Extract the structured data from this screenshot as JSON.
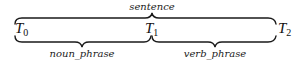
{
  "diagram": {
    "top_brace": {
      "label": "sentence",
      "from": "T0",
      "to": "T2"
    },
    "tokens": [
      {
        "name": "T",
        "sub": "0"
      },
      {
        "name": "T",
        "sub": "1"
      },
      {
        "name": "T",
        "sub": "2"
      }
    ],
    "bottom_braces": [
      {
        "label": "noun_phrase",
        "from": "T0",
        "to": "T1"
      },
      {
        "label": "verb_phrase",
        "from": "T1",
        "to": "T2"
      }
    ]
  }
}
